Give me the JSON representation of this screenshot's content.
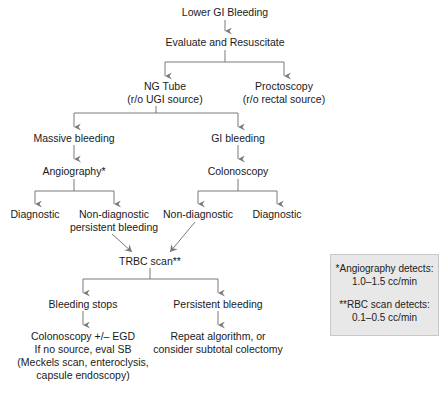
{
  "diagram": {
    "type": "flowchart",
    "title": "Lower GI Bleeding",
    "line_color": "#7a7a7a",
    "legend_bg": "#e8e8e8",
    "nodes": {
      "start": "Lower GI Bleeding",
      "evaluate": "Evaluate and Resuscitate",
      "ng_tube_1": "NG Tube",
      "ng_tube_2": "(r/o UGI source)",
      "proctoscopy_1": "Proctoscopy",
      "proctoscopy_2": "(r/o rectal source)",
      "massive": "Massive bleeding",
      "gi_bleeding": "GI bleeding",
      "angiography": "Angiography*",
      "colonoscopy": "Colonoscopy",
      "angio_diagnostic": "Diagnostic",
      "angio_nondiag_1": "Non-diagnostic",
      "angio_nondiag_2": "persistent bleeding",
      "colo_nondiag": "Non-diagnostic",
      "colo_diagnostic": "Diagnostic",
      "trbc": "TRBC scan**",
      "bleeding_stops": "Bleeding stops",
      "persistent": "Persistent bleeding",
      "stops_outcome_1": "Colonoscopy +/– EGD",
      "stops_outcome_2": "If no source, eval SB",
      "stops_outcome_3": "(Meckels scan, enteroclysis,",
      "stops_outcome_4": "capsule endoscopy)",
      "persist_outcome_1": "Repeat algorithm, or",
      "persist_outcome_2": "consider subtotal colectomy"
    },
    "legend": {
      "angio_1": "*Angiography detects:",
      "angio_2": "1.0–1.5 cc/min",
      "rbc_1": "**RBC scan detects:",
      "rbc_2": "0.1–0.5 cc/min"
    }
  }
}
